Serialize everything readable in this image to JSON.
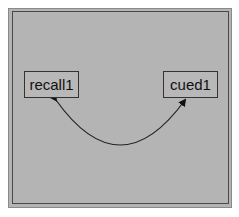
{
  "diagram": {
    "nodes": [
      {
        "id": "recall1",
        "label": "recall1"
      },
      {
        "id": "cued1",
        "label": "cued1"
      }
    ],
    "edges": [
      {
        "from": "recall1",
        "to": "cued1",
        "type": "double-headed-curved-arrow"
      }
    ],
    "colors": {
      "background": "#b4b4b4",
      "border": "#333333",
      "line": "#222222"
    }
  }
}
